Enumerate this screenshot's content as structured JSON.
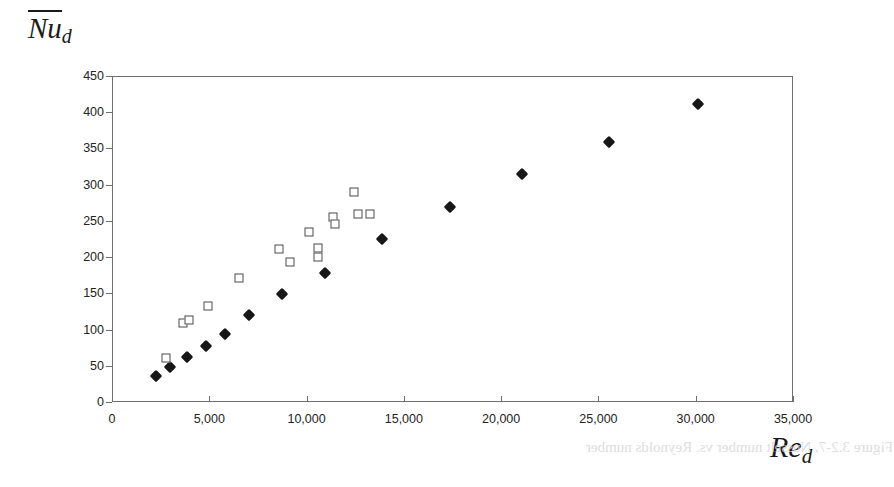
{
  "axes": {
    "ylabel": {
      "base": "Nu",
      "subscript": "d",
      "overbar": true
    },
    "xlabel": {
      "base": "Re",
      "subscript": "d"
    },
    "yticks": [
      "0",
      "50",
      "100",
      "150",
      "200",
      "250",
      "300",
      "350",
      "400",
      "450"
    ],
    "xticks": [
      "0",
      "5,000",
      "10,000",
      "15,000",
      "20,000",
      "25,000",
      "30,000",
      "35,000"
    ]
  },
  "artifact": {
    "bleed_text": "Figure 3.2-7, Nusselt number vs. Reynolds number"
  },
  "chart_data": {
    "type": "scatter",
    "title": "",
    "xlabel": "Re_d",
    "ylabel": "Nu_d",
    "xlim": [
      0,
      35000
    ],
    "ylim": [
      0,
      450
    ],
    "xtick_step": 5000,
    "ytick_step": 50,
    "grid": false,
    "legend": "none",
    "series": [
      {
        "name": "filled-diamond",
        "marker": "filled diamond",
        "color": "#171717",
        "points": [
          [
            2210,
            37
          ],
          [
            2930,
            50
          ],
          [
            3800,
            64
          ],
          [
            4780,
            79
          ],
          [
            5760,
            95
          ],
          [
            7000,
            122
          ],
          [
            8700,
            151
          ],
          [
            10900,
            180
          ],
          [
            13800,
            226
          ],
          [
            17300,
            270
          ],
          [
            21000,
            316
          ],
          [
            25500,
            360
          ],
          [
            30050,
            413
          ]
        ]
      },
      {
        "name": "open-square",
        "marker": "open square",
        "color": "#4a4a4a",
        "points": [
          [
            2700,
            62
          ],
          [
            3600,
            110
          ],
          [
            3900,
            114
          ],
          [
            4900,
            134
          ],
          [
            6500,
            172
          ],
          [
            8550,
            213
          ],
          [
            9100,
            195
          ],
          [
            10050,
            236
          ],
          [
            10550,
            201
          ],
          [
            10550,
            214
          ],
          [
            11300,
            257
          ],
          [
            11400,
            247
          ],
          [
            12400,
            291
          ],
          [
            12600,
            261
          ],
          [
            13200,
            261
          ]
        ]
      }
    ]
  }
}
